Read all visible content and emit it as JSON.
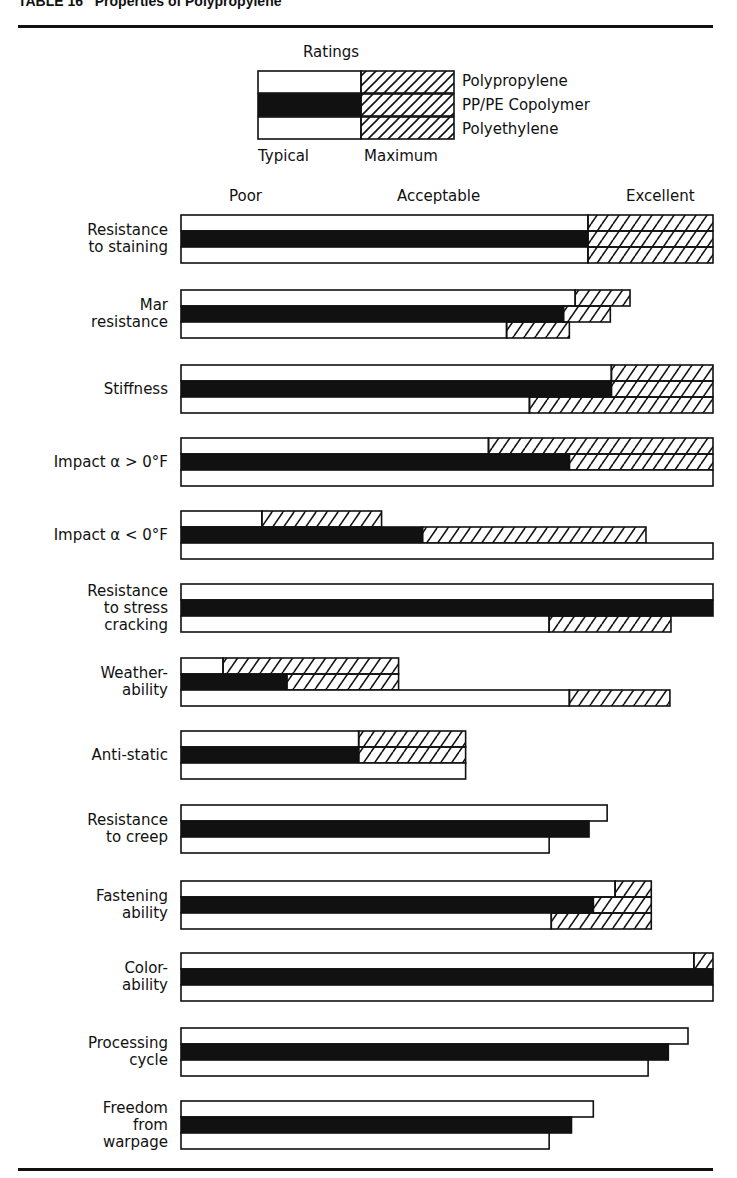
{
  "header": {
    "title": "TABLE 16   Properties of Polypropylene"
  },
  "legend": {
    "title": "Ratings",
    "series": [
      "Polypropylene",
      "PP/PE Copolymer",
      "Polyethylene"
    ],
    "typical_label": "Typical",
    "maximum_label": "Maximum"
  },
  "scale": {
    "poor": "Poor",
    "acceptable": "Acceptable",
    "excellent": "Excellent"
  },
  "colors": {
    "copolymer_fill": "#111111",
    "outline": "#111111",
    "background": "#ffffff"
  },
  "chart_data": {
    "type": "bar",
    "orientation": "horizontal",
    "title": "TABLE 16 Properties of Polypropylene",
    "xlabel": "Ratings (Poor – Acceptable – Excellent)",
    "ylabel": "",
    "xlim": [
      0,
      100
    ],
    "x_tick_labels": [
      "Poor",
      "Acceptable",
      "Excellent"
    ],
    "legend": [
      "Polypropylene",
      "PP/PE Copolymer",
      "Polyethylene"
    ],
    "legend_meaning": {
      "solid_or_open": "Typical",
      "hatched_extension": "Maximum"
    },
    "categories": [
      "Resistance to staining",
      "Mar resistance",
      "Stiffness",
      "Impact α > 0°F",
      "Impact α < 0°F",
      "Resistance to stress cracking",
      "Weatherability",
      "Anti-static",
      "Resistance to creep",
      "Fastening ability",
      "Colorability",
      "Processing cycle",
      "Freedom from warpage"
    ],
    "series": [
      {
        "name": "Polypropylene",
        "typical": [
          76.5,
          74.1,
          80.9,
          57.8,
          15.2,
          100,
          7.9,
          33.4,
          80.1,
          81.6,
          96.4,
          95.3,
          77.5
        ],
        "maximum": [
          100,
          84.4,
          100,
          100,
          37.7,
          100,
          40.9,
          53.5,
          80.1,
          88.4,
          100,
          95.3,
          77.5
        ]
      },
      {
        "name": "PP/PE Copolymer",
        "typical": [
          76.5,
          71.9,
          80.9,
          73.0,
          45.4,
          100,
          19.9,
          33.4,
          76.7,
          77.5,
          100,
          91.6,
          73.4
        ],
        "maximum": [
          100,
          80.7,
          100,
          100,
          87.4,
          100,
          40.9,
          53.5,
          76.7,
          88.4,
          100,
          91.6,
          73.4
        ]
      },
      {
        "name": "Polyethylene",
        "typical": [
          76.5,
          61.2,
          65.5,
          100,
          100,
          69.2,
          73.0,
          53.5,
          69.2,
          69.6,
          100,
          87.8,
          69.2
        ],
        "maximum": [
          100,
          73.0,
          100,
          100,
          100,
          92.1,
          91.9,
          53.5,
          69.2,
          88.4,
          100,
          87.8,
          69.2
        ]
      }
    ]
  },
  "rows": [
    {
      "label_lines": [
        "Resistance",
        "to staining"
      ],
      "top": 215
    },
    {
      "label_lines": [
        "Mar",
        "resistance"
      ],
      "top": 290
    },
    {
      "label_lines": [
        "Stiffness"
      ],
      "top": 365
    },
    {
      "label_lines": [
        "Impact α > 0°F"
      ],
      "top": 438
    },
    {
      "label_lines": [
        "Impact α < 0°F"
      ],
      "top": 511
    },
    {
      "label_lines": [
        "Resistance",
        "to stress",
        "cracking"
      ],
      "top": 584
    },
    {
      "label_lines": [
        "Weather-",
        "ability"
      ],
      "top": 658
    },
    {
      "label_lines": [
        "Anti-static"
      ],
      "top": 731
    },
    {
      "label_lines": [
        "Resistance",
        "to creep"
      ],
      "top": 805
    },
    {
      "label_lines": [
        "Fastening",
        "ability"
      ],
      "top": 881
    },
    {
      "label_lines": [
        "Color-",
        "ability"
      ],
      "top": 953
    },
    {
      "label_lines": [
        "Processing",
        "cycle"
      ],
      "top": 1028
    },
    {
      "label_lines": [
        "Freedom",
        "from",
        "warpage"
      ],
      "top": 1101
    }
  ]
}
